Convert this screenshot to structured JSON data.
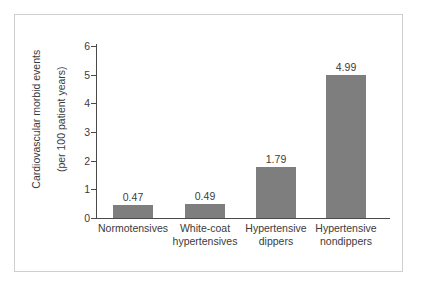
{
  "chart_data": {
    "type": "bar",
    "title": "",
    "xlabel": "",
    "ylabel": "Cardiovascular morbid events (per 100 patient years)",
    "ylabel_lines": [
      "Cardiovascular morbid events",
      "(per 100 patient years)"
    ],
    "categories": [
      "Normotensives",
      "White-coat hypertensives",
      "Hypertensive dippers",
      "Hypertensive nondippers"
    ],
    "category_lines": [
      [
        "Normotensives"
      ],
      [
        "White-coat",
        "hypertensives"
      ],
      [
        "Hypertensive",
        "dippers"
      ],
      [
        "Hypertensive",
        "nondippers"
      ]
    ],
    "values": [
      0.47,
      0.49,
      1.79,
      4.99
    ],
    "value_labels": [
      "0.47",
      "0.49",
      "1.79",
      "4.99"
    ],
    "ylim": [
      0,
      6
    ],
    "yticks": [
      0,
      1,
      2,
      3,
      4,
      5,
      6
    ],
    "ytick_labels": [
      "0",
      "1",
      "2",
      "3",
      "4",
      "5",
      "6"
    ],
    "grid": false,
    "legend": null,
    "bar_color": "#7e7e7e",
    "axis_color": "#4a4a4a",
    "text_color": "#3b3b3b",
    "frame_color": "#cfcfcf",
    "background": "#ffffff"
  }
}
